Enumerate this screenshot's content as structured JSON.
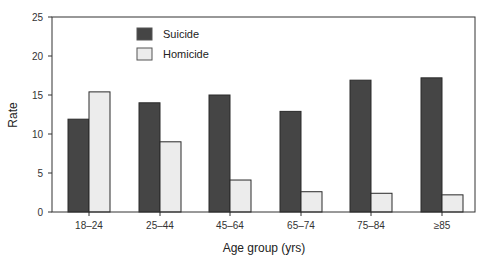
{
  "chart_data": {
    "type": "bar",
    "title": "",
    "xlabel": "Age group (yrs)",
    "ylabel": "Rate",
    "ylim": [
      0,
      25
    ],
    "yticks": [
      0,
      5,
      10,
      15,
      20,
      25
    ],
    "grid": false,
    "legend_position": "upper-left inside",
    "categories": [
      "18–24",
      "25–44",
      "45–64",
      "65–74",
      "75–84",
      "≥85"
    ],
    "series": [
      {
        "name": "Suicide",
        "color": "#454545",
        "values": [
          11.9,
          14.0,
          15.0,
          12.9,
          16.9,
          17.2
        ]
      },
      {
        "name": "Homicide",
        "color": "#ececec",
        "values": [
          15.4,
          9.0,
          4.1,
          2.6,
          2.4,
          2.2
        ]
      }
    ]
  }
}
